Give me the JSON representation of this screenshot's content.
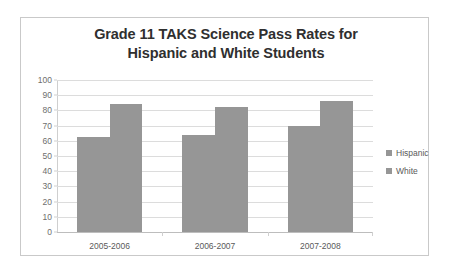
{
  "chart_data": {
    "type": "bar",
    "title": "Grade 11 TAKS Science Pass Rates for Hispanic and White Students",
    "title_lines": [
      "Grade 11 TAKS Science Pass Rates for",
      "Hispanic and White Students"
    ],
    "xlabel": "",
    "ylabel": "",
    "ylim": [
      0,
      100
    ],
    "ytick_step": 10,
    "yticks": [
      "100",
      "90",
      "80",
      "70",
      "60",
      "50",
      "40",
      "30",
      "20",
      "10",
      "0"
    ],
    "grid": true,
    "legend_position": "right",
    "categories": [
      "2005-2006",
      "2006-2007",
      "2007-2008"
    ],
    "series": [
      {
        "name": "Hispanic",
        "values": [
          62.5,
          63.5,
          70
        ],
        "color": "#969696"
      },
      {
        "name": "White",
        "values": [
          84,
          82.5,
          86
        ],
        "color": "#969696"
      }
    ]
  },
  "colors": {
    "bar_fill": "#969696",
    "gridline": "#dcdcdc",
    "frame_border": "#c9c9c9",
    "title_text": "#2f2f2f",
    "tick_text": "#6e6e6e"
  }
}
